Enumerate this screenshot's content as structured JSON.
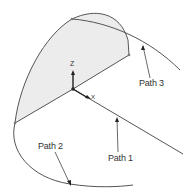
{
  "diagram": {
    "axes": {
      "z_label": "Z",
      "x_label": "X"
    },
    "labels": {
      "path1": "Path 1",
      "path2": "Path 2",
      "path3": "Path 3"
    },
    "colors": {
      "curve": "#555555",
      "face_fill": "#ececec",
      "leader": "#444444",
      "background": "#ffffff"
    }
  }
}
